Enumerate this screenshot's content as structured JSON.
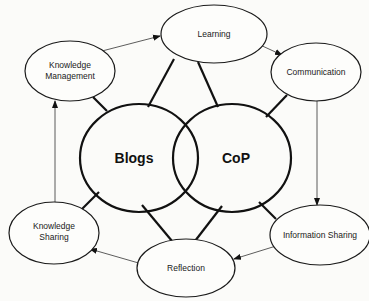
{
  "diagram": {
    "core": [
      {
        "id": "blogs",
        "label": "Blogs"
      },
      {
        "id": "cop",
        "label": "CoP"
      }
    ],
    "nodes": [
      {
        "id": "learning",
        "lines": [
          "Learning"
        ]
      },
      {
        "id": "communication",
        "lines": [
          "Communication"
        ]
      },
      {
        "id": "information_sharing",
        "lines": [
          "Information Sharing"
        ]
      },
      {
        "id": "reflection",
        "lines": [
          "Reflection"
        ]
      },
      {
        "id": "knowledge_sharing",
        "lines": [
          "Knowledge",
          "Sharing"
        ]
      },
      {
        "id": "knowledge_management",
        "lines": [
          "Knowledge",
          "Management"
        ]
      }
    ],
    "arrows": [
      {
        "from": "knowledge_management",
        "to": "learning"
      },
      {
        "from": "learning",
        "to": "communication"
      },
      {
        "from": "communication",
        "to": "information_sharing"
      },
      {
        "from": "information_sharing",
        "to": "reflection"
      },
      {
        "from": "reflection",
        "to": "knowledge_sharing"
      },
      {
        "from": "knowledge_sharing",
        "to": "knowledge_management"
      }
    ],
    "links": [
      {
        "from": "blogs",
        "to": "knowledge_management"
      },
      {
        "from": "blogs",
        "to": "learning"
      },
      {
        "from": "blogs",
        "to": "knowledge_sharing"
      },
      {
        "from": "blogs",
        "to": "reflection"
      },
      {
        "from": "cop",
        "to": "learning"
      },
      {
        "from": "cop",
        "to": "communication"
      },
      {
        "from": "cop",
        "to": "information_sharing"
      },
      {
        "from": "cop",
        "to": "reflection"
      }
    ],
    "colors": {
      "stroke": "#111111",
      "background": "#fbfbf9"
    }
  }
}
